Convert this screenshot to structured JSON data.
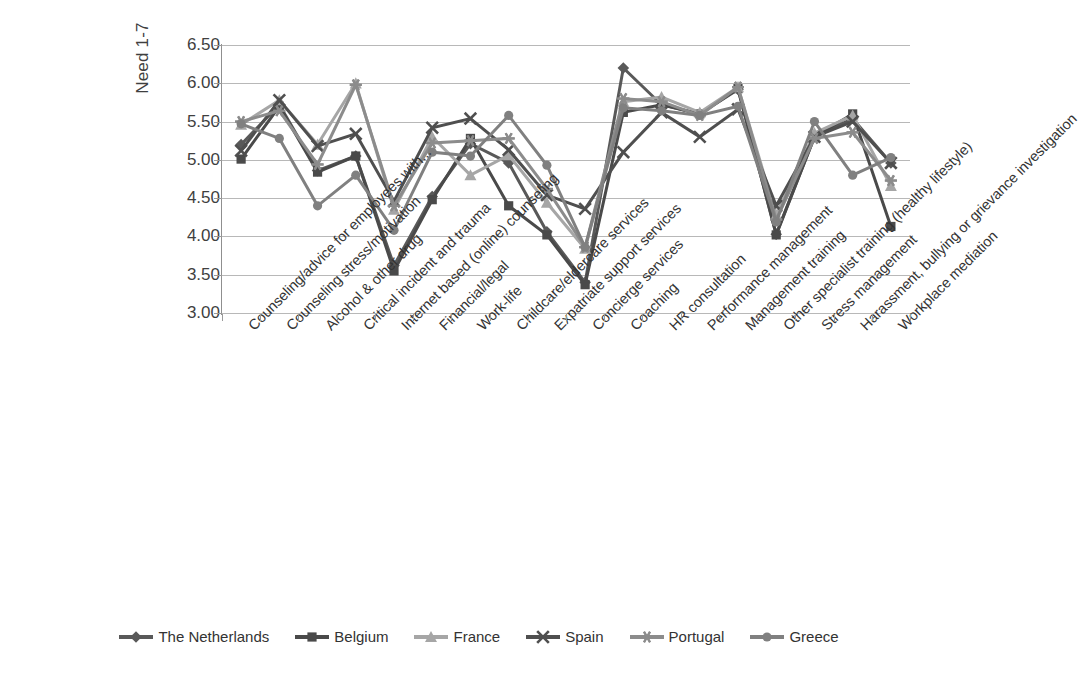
{
  "chart_data": {
    "type": "line",
    "title": "",
    "xlabel": "",
    "ylabel": "Need 1-7",
    "ylim": [
      3.0,
      6.5
    ],
    "yticks": [
      "3.00",
      "3.50",
      "4.00",
      "4.50",
      "5.00",
      "5.50",
      "6.00",
      "6.50"
    ],
    "grid": true,
    "legend_position": "bottom",
    "categories": [
      "Counseling/advice for employees with...",
      "Counseling stress/motivation",
      "Alcohol & other drug",
      "Critical incident and trauma",
      "Internet based (online) counseling",
      "Financial/legal",
      "Work-life",
      "Childcare/eldercare services",
      "Expatriate support services",
      "Concierge services",
      "Coaching",
      "HR consultation",
      "Performance management",
      "Management training",
      "Other specialist training (healthy lifestyle)",
      "Stress management",
      "Harassment, bullying or grievance investigation",
      "Workplace mediation"
    ],
    "series": [
      {
        "name": "The Netherlands",
        "marker": "diamond",
        "color": "#595959",
        "values": [
          5.2,
          5.72,
          4.86,
          5.05,
          3.62,
          4.52,
          5.21,
          4.96,
          4.06,
          3.4,
          6.2,
          5.72,
          5.6,
          5.92,
          4.03,
          5.3,
          5.54,
          4.96
        ]
      },
      {
        "name": "Belgium",
        "marker": "square",
        "color": "#4a4a4a",
        "values": [
          5.01,
          5.7,
          4.84,
          5.05,
          3.55,
          4.48,
          5.28,
          4.4,
          4.02,
          3.37,
          5.62,
          5.72,
          5.6,
          5.93,
          4.02,
          5.3,
          5.6,
          4.13
        ]
      },
      {
        "name": "France",
        "marker": "triangle",
        "color": "#a6a6a6",
        "values": [
          5.46,
          5.78,
          5.2,
          6.0,
          4.35,
          5.3,
          4.8,
          5.06,
          4.44,
          3.84,
          5.76,
          5.82,
          5.62,
          5.95,
          4.28,
          5.35,
          5.58,
          4.66
        ]
      },
      {
        "name": "Spain",
        "marker": "x",
        "color": "#4f4f4f",
        "values": [
          5.12,
          5.78,
          5.18,
          5.34,
          4.46,
          5.42,
          5.54,
          5.13,
          4.54,
          4.36,
          5.1,
          5.62,
          5.3,
          5.66,
          4.4,
          5.3,
          5.5,
          4.96
        ]
      },
      {
        "name": "Portugal",
        "marker": "asterisk",
        "color": "#8c8c8c",
        "values": [
          5.5,
          5.64,
          4.94,
          5.98,
          4.4,
          5.22,
          5.25,
          5.28,
          4.62,
          3.86,
          5.8,
          5.76,
          5.58,
          5.95,
          4.22,
          5.28,
          5.36,
          4.73
        ]
      },
      {
        "name": "Greece",
        "marker": "circle",
        "color": "#808080",
        "values": [
          5.47,
          5.28,
          4.4,
          4.8,
          4.08,
          5.1,
          5.05,
          5.58,
          4.93,
          3.86,
          5.68,
          5.64,
          5.58,
          5.7,
          4.19,
          5.5,
          4.8,
          5.03
        ]
      }
    ]
  },
  "legend": {
    "items": [
      {
        "label": "The Netherlands"
      },
      {
        "label": "Belgium"
      },
      {
        "label": "France"
      },
      {
        "label": "Spain"
      },
      {
        "label": "Portugal"
      },
      {
        "label": "Greece"
      }
    ]
  }
}
